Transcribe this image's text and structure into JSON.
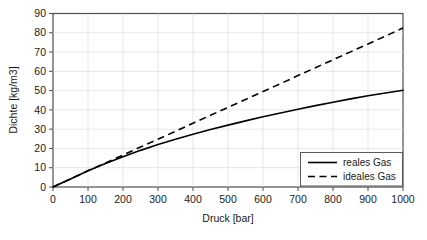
{
  "chart_data": {
    "type": "line",
    "title": "",
    "xlabel": "Druck [bar]",
    "ylabel": "Dichte [kg/m3]",
    "xlim": [
      0,
      1000
    ],
    "ylim": [
      0,
      90
    ],
    "xticks": [
      "0",
      "100",
      "200",
      "300",
      "400",
      "500",
      "600",
      "700",
      "800",
      "900",
      "1000"
    ],
    "yticks": [
      "0",
      "10",
      "20",
      "30",
      "40",
      "50",
      "60",
      "70",
      "80",
      "90"
    ],
    "grid": true,
    "legend_position": "lower-right",
    "x": [
      0,
      50,
      100,
      150,
      200,
      250,
      300,
      350,
      400,
      450,
      500,
      550,
      600,
      650,
      700,
      750,
      800,
      850,
      900,
      950,
      1000
    ],
    "series": [
      {
        "name": "reales Gas",
        "style": "solid",
        "color": "#000000",
        "values": [
          0,
          4.2,
          8.4,
          12.2,
          15.7,
          19.0,
          22.0,
          24.8,
          27.4,
          29.8,
          32.1,
          34.3,
          36.4,
          38.4,
          40.3,
          42.2,
          44.0,
          45.7,
          47.3,
          48.8,
          50.2
        ]
      },
      {
        "name": "ideales Gas",
        "style": "dashed",
        "color": "#000000",
        "values": [
          0,
          4.2,
          8.4,
          12.5,
          16.6,
          20.7,
          24.8,
          28.9,
          33.1,
          37.2,
          41.3,
          45.4,
          49.5,
          53.6,
          57.8,
          61.9,
          66.0,
          70.1,
          74.2,
          78.3,
          82.5
        ]
      }
    ]
  },
  "legend": {
    "entries": [
      {
        "label": "reales Gas"
      },
      {
        "label": "ideales Gas"
      }
    ]
  },
  "colors": {
    "frame": "#4d4d4d",
    "grid": "#d9dde3",
    "line": "#000000",
    "text": "#1a1a1a",
    "background": "#ffffff"
  }
}
